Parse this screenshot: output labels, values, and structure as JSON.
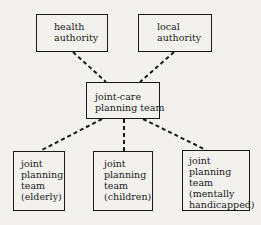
{
  "diagram": {
    "nodes": {
      "health": {
        "lines": [
          "health",
          "authority"
        ]
      },
      "local": {
        "lines": [
          "local",
          "authority"
        ]
      },
      "joint_care": {
        "lines": [
          "joint-care",
          "planning team"
        ]
      },
      "elderly": {
        "lines": [
          "joint",
          "planning",
          "team",
          "(elderly)"
        ]
      },
      "children": {
        "lines": [
          "joint",
          "planning",
          "team",
          "(children)"
        ]
      },
      "mentally": {
        "lines": [
          "joint",
          "planning",
          "team",
          "(mentally",
          "handicapped)"
        ]
      }
    },
    "edges": [
      {
        "from": "health",
        "to": "joint_care",
        "style": "dashed"
      },
      {
        "from": "local",
        "to": "joint_care",
        "style": "dashed"
      },
      {
        "from": "joint_care",
        "to": "elderly",
        "style": "dashed"
      },
      {
        "from": "joint_care",
        "to": "children",
        "style": "dashed"
      },
      {
        "from": "joint_care",
        "to": "mentally",
        "style": "dashed"
      }
    ]
  }
}
